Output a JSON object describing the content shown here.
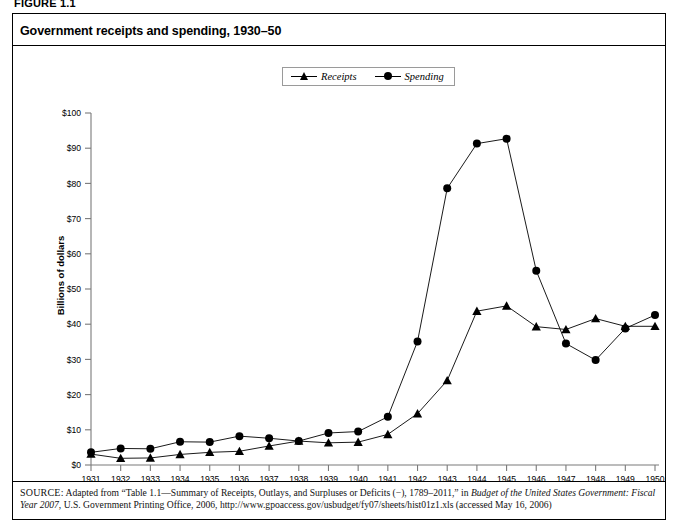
{
  "figure": {
    "label": "FIGURE 1.1"
  },
  "title": "Government receipts and spending, 1930–50",
  "legend": {
    "position": "top-center",
    "items": [
      {
        "label": "Receipts",
        "marker": "triangle-marker-icon",
        "color": "#000000"
      },
      {
        "label": "Spending",
        "marker": "circle-marker-icon",
        "color": "#000000"
      }
    ]
  },
  "axes": {
    "ylabel": "Billions of dollars",
    "yticks": [
      "$0",
      "$10",
      "$20",
      "$30",
      "$40",
      "$50",
      "$60",
      "$70",
      "$80",
      "$90",
      "$100"
    ],
    "xticks": [
      "1931",
      "1932",
      "1933",
      "1934",
      "1935",
      "1936",
      "1937",
      "1938",
      "1939",
      "1940",
      "1941",
      "1942",
      "1943",
      "1944",
      "1945",
      "1946",
      "1947",
      "1948",
      "1949",
      "1950"
    ]
  },
  "source": {
    "prefix": "SOURCE:",
    "text_1": " Adapted from “Table 1.1—Summary of Receipts, Outlays, and Surpluses or Deficits (−), 1789–2011,” in ",
    "italic_1": "Budget of the United States Government: Fiscal Year 2007",
    "text_2": ", U.S. Government Printing Office, 2006, http://www.gpoaccess.gov/usbudget/fy07/sheets/hist01z1.xls (accessed May 16, 2006)"
  },
  "chart_data": {
    "type": "line",
    "title": "Government receipts and spending, 1930–50",
    "xlabel": "",
    "ylabel": "Billions of dollars",
    "ylim": [
      0,
      100
    ],
    "ytick_step": 10,
    "grid": false,
    "legend_position": "top-center",
    "categories": [
      "1931",
      "1932",
      "1933",
      "1934",
      "1935",
      "1936",
      "1937",
      "1938",
      "1939",
      "1940",
      "1941",
      "1942",
      "1943",
      "1944",
      "1945",
      "1946",
      "1947",
      "1948",
      "1949",
      "1950"
    ],
    "series": [
      {
        "name": "Receipts",
        "marker": "triangle",
        "values": [
          3.1,
          1.9,
          2.0,
          3.0,
          3.6,
          3.9,
          5.4,
          6.8,
          6.3,
          6.5,
          8.7,
          14.6,
          24.0,
          43.7,
          45.2,
          39.3,
          38.5,
          41.6,
          39.4,
          39.4
        ]
      },
      {
        "name": "Spending",
        "marker": "circle",
        "values": [
          3.6,
          4.7,
          4.6,
          6.6,
          6.5,
          8.2,
          7.6,
          6.8,
          9.1,
          9.5,
          13.7,
          35.1,
          78.6,
          91.3,
          92.7,
          55.2,
          34.5,
          29.8,
          38.8,
          42.6
        ]
      }
    ]
  },
  "colors": {
    "line": "#000000",
    "axis": "#7a7a7a",
    "frame": "#000000",
    "background": "#ffffff"
  }
}
